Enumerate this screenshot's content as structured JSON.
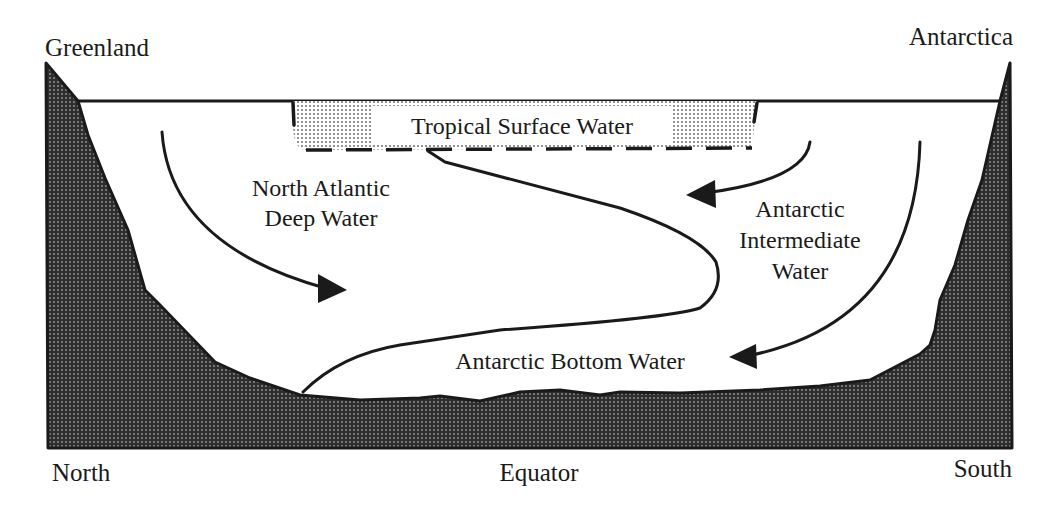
{
  "diagram": {
    "corner_labels": {
      "north_landmass": "Greenland",
      "south_landmass": "Antarctica"
    },
    "axis_labels": {
      "left": "North",
      "center": "Equator",
      "right": "South"
    },
    "water_masses": {
      "tropical_surface": "Tropical Surface Water",
      "nadw_line1": "North Atlantic",
      "nadw_line2": "Deep Water",
      "aaiw_line1": "Antarctic",
      "aaiw_line2": "Intermediate",
      "aaiw_line3": "Water",
      "aabw": "Antarctic Bottom Water"
    },
    "flows": [
      {
        "name": "North Atlantic Deep Water",
        "direction": "southward, sinking"
      },
      {
        "name": "Antarctic Intermediate Water",
        "direction": "northward, intermediate depth"
      },
      {
        "name": "Antarctic Bottom Water",
        "direction": "northward, along bottom"
      }
    ],
    "colors": {
      "ink": "#1a1a1a",
      "background": "#ffffff",
      "land_fill": "#3a3a3a",
      "tropical_fill": "#c8c8c8"
    }
  }
}
